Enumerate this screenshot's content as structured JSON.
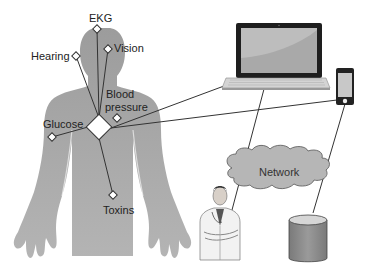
{
  "diagram": {
    "type": "body-area sensor network",
    "sensors": [
      {
        "id": "ekg",
        "label": "EKG"
      },
      {
        "id": "vision",
        "label": "Vision"
      },
      {
        "id": "hearing",
        "label": "Hearing"
      },
      {
        "id": "blood_pressure",
        "label_line1": "Blood",
        "label_line2": "pressure"
      },
      {
        "id": "glucose",
        "label": "Glucose"
      },
      {
        "id": "toxins",
        "label": "Toxins"
      }
    ],
    "hub": {
      "label": ""
    },
    "devices": [
      {
        "id": "laptop",
        "icon": "laptop-icon"
      },
      {
        "id": "phone",
        "icon": "smartphone-icon"
      },
      {
        "id": "network",
        "label": "Network",
        "icon": "cloud-icon"
      },
      {
        "id": "doctor",
        "icon": "doctor-icon"
      },
      {
        "id": "database",
        "icon": "database-icon"
      }
    ],
    "colors": {
      "body": "#a8a8a8",
      "cloud": "#b4b4b4",
      "database": "#8c8c8c",
      "screen": "#b8b8b8",
      "line": "#333333"
    }
  }
}
